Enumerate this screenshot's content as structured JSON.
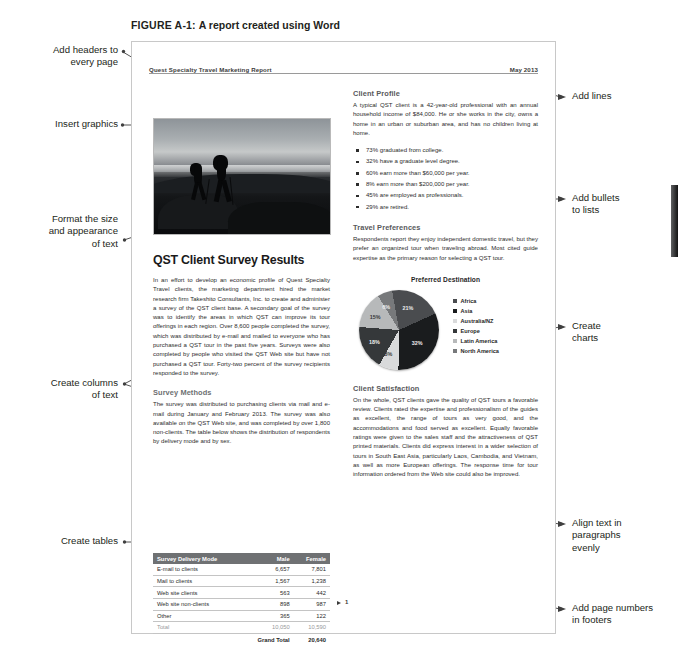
{
  "figure": {
    "label": "FIGURE A-1:",
    "title": "A report created using Word"
  },
  "document": {
    "header": {
      "left": "Quest Specialty Travel Marketing Report",
      "right": "May 2013"
    },
    "photo_alt": "two-hikers-at-dusk-photo",
    "left_column": {
      "title": "QST Client Survey Results",
      "intro": "In an effort to develop an economic profile of Quest Specialty Travel clients, the marketing department hired the market research firm Takeshito Consultants, Inc. to create and administer a survey of the QST client base. A secondary goal of the survey was to identify the areas in which QST can improve its tour offerings in each region. Over 8,600 people completed the survey, which was distributed by e-mail and mailed to everyone who has purchased a QST tour in the past five years. Surveys were also completed by people who visited the QST Web site but have not purchased a QST tour. Forty-two percent of the survey recipients responded to the survey.",
      "methods_heading": "Survey Methods",
      "methods_body": "The survey was distributed to purchasing clients via mail and e-mail during January and February 2013. The survey was also available on the QST Web site, and was completed by over 1,800 non-clients. The table below shows the distribution of respondents by delivery mode and by sex.",
      "table": {
        "columns": [
          "Survey Delivery Mode",
          "Male",
          "Female"
        ],
        "rows": [
          [
            "E-mail to clients",
            "6,657",
            "7,801"
          ],
          [
            "Mail to clients",
            "1,567",
            "1,238"
          ],
          [
            "Web site clients",
            "563",
            "442"
          ],
          [
            "Web site non-clients",
            "898",
            "987"
          ],
          [
            "Other",
            "365",
            "122"
          ]
        ],
        "total_row": [
          "Total",
          "10,050",
          "10,590"
        ],
        "grand_total_label": "Grand Total",
        "grand_total_value": "20,640"
      }
    },
    "right_column": {
      "profile_heading": "Client Profile",
      "profile_body": "A typical QST client is a 42-year-old professional with an annual household income of $84,000. He or she works in the city, owns a home in an urban or suburban area, and has no children living at home.",
      "bullets": [
        "73% graduated from college.",
        "32% have a graduate level degree.",
        "60% earn more than $60,000 per year.",
        "8% earn more than $200,000 per year.",
        "45% are employed as professionals.",
        "29% are retired."
      ],
      "preferences_heading": "Travel Preferences",
      "preferences_body": "Respondents report they enjoy independent domestic travel, but they prefer an organized tour when traveling abroad. Most cited guide expertise as the primary reason for selecting a QST tour.",
      "satisfaction_heading": "Client Satisfaction",
      "satisfaction_body": "On the whole, QST clients gave the quality of QST tours a favorable review. Clients rated the expertise and professionalism of the guides as excellent, the range of tours as very good, and the accommodations and food served as excellent. Equally favorable ratings were given to the sales staff and the attractiveness of QST printed materials. Clients did express interest in a wider selection of tours in South East Asia, particularly Laos, Cambodia, and Vietnam, as well as more European offerings. The response time for tour information ordered from the Web site could also be improved."
    },
    "footer": {
      "page_number": "1"
    }
  },
  "chart_data": {
    "type": "pie",
    "title": "Preferred Destination",
    "categories": [
      "Africa",
      "Asia",
      "Australia/NZ",
      "Europe",
      "Latin America",
      "North America"
    ],
    "values": [
      21,
      32,
      8,
      18,
      15,
      6
    ],
    "labels": [
      "21%",
      "32%",
      "8%",
      "18%",
      "15%",
      "6%"
    ],
    "colors": [
      "#4a4c4f",
      "#1a1c1e",
      "#d9dadb",
      "#35383a",
      "#b7b9ba",
      "#77797b"
    ],
    "legend_position": "right",
    "grid": false
  },
  "callouts": {
    "left": [
      {
        "id": "add-headers",
        "text": "Add headers to\nevery page"
      },
      {
        "id": "insert-graphics",
        "text": "Insert graphics"
      },
      {
        "id": "format-text",
        "text": "Format the size\nand appearance\nof text"
      },
      {
        "id": "create-columns",
        "text": "Create columns\nof text"
      },
      {
        "id": "create-tables",
        "text": "Create tables"
      }
    ],
    "right": [
      {
        "id": "add-lines",
        "text": "Add lines"
      },
      {
        "id": "add-bullets",
        "text": "Add bullets\nto lists"
      },
      {
        "id": "create-charts",
        "text": "Create\ncharts"
      },
      {
        "id": "align-text",
        "text": "Align text in\nparagraphs\nevenly"
      },
      {
        "id": "page-numbers",
        "text": "Add page numbers\nin footers"
      }
    ]
  }
}
